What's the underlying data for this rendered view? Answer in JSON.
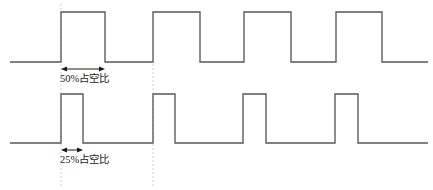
{
  "figure": {
    "type": "timing-diagram",
    "stroke_color": "#555555",
    "text_color": "#1a1a1a",
    "guide_color": "#bbbbbb",
    "background": "#ffffff",
    "width": 433,
    "height": 190
  },
  "annotations": {
    "top_label": "50%占空比",
    "bottom_label": "25%占空比"
  },
  "chart_data": {
    "type": "line",
    "title": "",
    "xlabel": "",
    "ylabel": "",
    "grid": false,
    "legend": "none",
    "xlim": [
      0,
      433
    ],
    "series": [
      {
        "name": "50%占空比",
        "duty_cycle_percent": 50,
        "period_px": 91,
        "baseline_y": 62,
        "high_y": 12,
        "start_x": 10,
        "end_x": 428,
        "edges_x": [
          61,
          105,
          153,
          200,
          244,
          291,
          336,
          382
        ],
        "pulse_count": 4,
        "points": [
          [
            10,
            62
          ],
          [
            61,
            62
          ],
          [
            61,
            12
          ],
          [
            105,
            12
          ],
          [
            105,
            62
          ],
          [
            153,
            62
          ],
          [
            153,
            12
          ],
          [
            200,
            12
          ],
          [
            200,
            62
          ],
          [
            244,
            62
          ],
          [
            244,
            12
          ],
          [
            291,
            12
          ],
          [
            291,
            62
          ],
          [
            336,
            62
          ],
          [
            336,
            12
          ],
          [
            382,
            12
          ],
          [
            382,
            62
          ],
          [
            428,
            62
          ]
        ]
      },
      {
        "name": "25%占空比",
        "duty_cycle_percent": 25,
        "period_px": 91,
        "baseline_y": 143,
        "high_y": 94,
        "start_x": 10,
        "end_x": 428,
        "edges_x": [
          61,
          83,
          153,
          175,
          243,
          266,
          335,
          358
        ],
        "pulse_count": 4,
        "points": [
          [
            10,
            143
          ],
          [
            61,
            143
          ],
          [
            61,
            94
          ],
          [
            83,
            94
          ],
          [
            83,
            143
          ],
          [
            153,
            143
          ],
          [
            153,
            94
          ],
          [
            175,
            94
          ],
          [
            175,
            143
          ],
          [
            243,
            143
          ],
          [
            243,
            94
          ],
          [
            266,
            94
          ],
          [
            266,
            143
          ],
          [
            335,
            143
          ],
          [
            335,
            94
          ],
          [
            358,
            94
          ],
          [
            358,
            143
          ],
          [
            428,
            143
          ]
        ]
      }
    ],
    "dimension_arrows": [
      {
        "name": "50%占空比",
        "x1": 61,
        "x2": 105,
        "y": 69
      },
      {
        "name": "25%占空比",
        "x1": 61,
        "x2": 83,
        "y": 150
      }
    ],
    "guide_lines": [
      {
        "x": 61,
        "y1": 4,
        "y2": 186
      },
      {
        "x": 153,
        "y1": 64,
        "y2": 186
      }
    ]
  }
}
